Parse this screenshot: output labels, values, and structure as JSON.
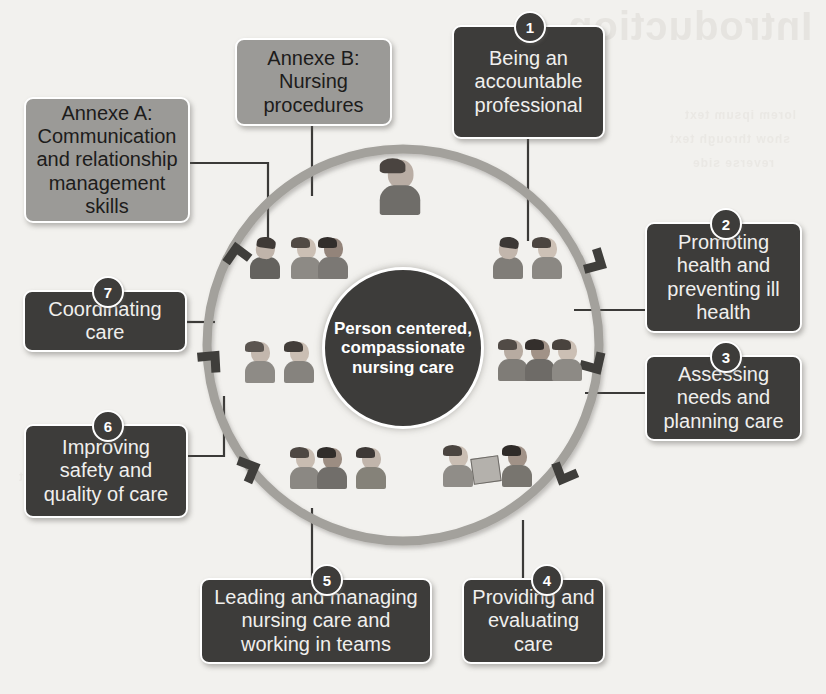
{
  "diagram": {
    "centre_label": "Person centered, compassionate nursing care",
    "background_color": "#f2f1ee",
    "dark_node_color": "#3d3c3a",
    "grey_node_color": "#9b9a97",
    "ring_color": "#a3a19c",
    "connector_color": "#3b3a38"
  },
  "watermark": {
    "title": "Introduction",
    "line1": "lorem ipsum text",
    "line2": "show through text",
    "line3": "reverse side",
    "line4": "faint bleed text"
  },
  "platforms": [
    {
      "number": "1",
      "label": "Being an accountable professional"
    },
    {
      "number": "2",
      "label": "Promoting health and preventing ill health"
    },
    {
      "number": "3",
      "label": "Assessing needs and planning care"
    },
    {
      "number": "4",
      "label": "Providing and evaluating care"
    },
    {
      "number": "5",
      "label": "Leading and managing nursing care and working in teams"
    },
    {
      "number": "6",
      "label": "Improving safety and quality of care"
    },
    {
      "number": "7",
      "label": "Coordinating care"
    }
  ],
  "annexes": [
    {
      "key": "A",
      "label": "Annexe A: Communication and relationship management skills"
    },
    {
      "key": "B",
      "label": "Annexe B: Nursing procedures"
    }
  ]
}
